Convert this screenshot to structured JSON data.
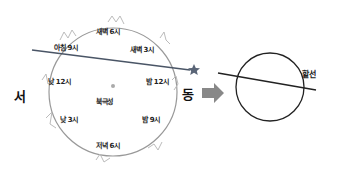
{
  "diagram": {
    "directions": {
      "west": "서",
      "east": "동"
    },
    "center_label": "북극성",
    "time_labels": [
      {
        "id": "dawn-6",
        "text": "새벽 6시"
      },
      {
        "id": "dawn-3",
        "text": "새벽 3시"
      },
      {
        "id": "morning-9",
        "text": "아침 9시"
      },
      {
        "id": "noon-12",
        "text": "낮 12시"
      },
      {
        "id": "midnight-12",
        "text": "밤 12시"
      },
      {
        "id": "afternoon-3",
        "text": "낮 3시"
      },
      {
        "id": "night-9",
        "text": "밤 9시"
      },
      {
        "id": "evening-6",
        "text": "저녁 6시"
      }
    ],
    "secant_label": "할선",
    "colors": {
      "circle_left": "#999999",
      "circle_right": "#222222",
      "line": "#4a5566",
      "arrow": "#888888",
      "star": "#5a6577",
      "constellation": "#bbbbbb"
    }
  }
}
